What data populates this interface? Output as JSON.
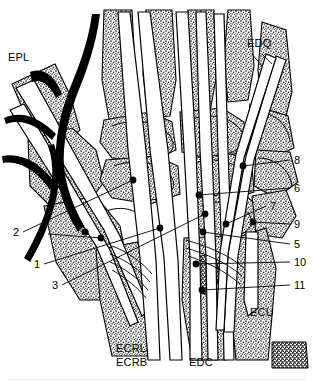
{
  "figure": {
    "kind": "anatomical-line-drawing",
    "view": "dorsal view of right wrist",
    "background_color": "#ffffff",
    "ink_color": "#000000",
    "stipple_fill": "#7d7d7d"
  },
  "tendon_labels": [
    {
      "id": "epl",
      "text": "EPL",
      "x": 8,
      "y": 52,
      "meaning": "extensor pollicis longus"
    },
    {
      "id": "edq",
      "text": "EDQ",
      "x": 247,
      "y": 38,
      "meaning": "extensor digiti quinti"
    },
    {
      "id": "ecu",
      "text": "ECU",
      "x": 250,
      "y": 307,
      "meaning": "extensor carpi ulnaris"
    },
    {
      "id": "ecrl",
      "text": "ECRL",
      "x": 116,
      "y": 343,
      "meaning": "extensor carpi radialis longus"
    },
    {
      "id": "ecrb",
      "text": "ECRB",
      "x": 116,
      "y": 357,
      "meaning": "extensor carpi radialis brevis"
    },
    {
      "id": "edc",
      "text": "EDC",
      "x": 189,
      "y": 357,
      "meaning": "extensor digitorum communis"
    }
  ],
  "numbered_callouts": [
    {
      "n": "1",
      "label_x": 34,
      "label_y": 264,
      "dot_x": 160,
      "dot_y": 228
    },
    {
      "n": "2",
      "label_x": 13,
      "label_y": 232,
      "dot_x": 133,
      "dot_y": 180
    },
    {
      "n": "3",
      "label_x": 52,
      "label_y": 285,
      "dot_x": 205,
      "dot_y": 214
    },
    {
      "n": "4",
      "label_x": 38,
      "label_y": 234,
      "dot_x": 101,
      "dot_y": 238
    },
    {
      "n": "5",
      "label_x": 294,
      "label_y": 244,
      "dot_x": 203,
      "dot_y": 232
    },
    {
      "n": "6",
      "label_x": 294,
      "label_y": 188,
      "dot_x": 199,
      "dot_y": 195
    },
    {
      "n": "7",
      "label_x": 270,
      "label_y": 206,
      "dot_x": 226,
      "dot_y": 224
    },
    {
      "n": "8",
      "label_x": 294,
      "label_y": 160,
      "dot_x": 243,
      "dot_y": 166
    },
    {
      "n": "9",
      "label_x": 294,
      "label_y": 224,
      "dot_x": 253,
      "dot_y": 222
    },
    {
      "n": "10",
      "label_x": 294,
      "label_y": 262,
      "dot_x": 196,
      "dot_y": 264
    },
    {
      "n": "11",
      "label_x": 294,
      "label_y": 285,
      "dot_x": 202,
      "dot_y": 290
    }
  ]
}
